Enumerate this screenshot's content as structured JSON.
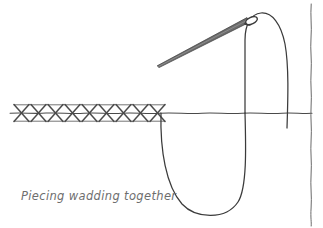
{
  "document": {
    "title": "Piecing wadding together",
    "type": "line-illustration",
    "background_color": "#ffffff",
    "width": 323,
    "height": 228
  },
  "caption": {
    "text": "Piecing wadding together",
    "color": "#6e6e6e",
    "style": "italic",
    "x": 21,
    "y": 189
  },
  "colors": {
    "ink": "#3b3b3b",
    "ink_light": "#5a5a5a",
    "needle_fill": "#6d6d6d",
    "needle_stroke": "#3b3b3b",
    "stitch": "#4a4a4a",
    "caption": "#6e6e6e",
    "background": "#ffffff"
  },
  "elements": {
    "fabric_seam_line": {
      "label": "fabric seam line",
      "y": 113,
      "x_start": 10,
      "x_end": 312,
      "color": "#4a4a4a"
    },
    "fabric_edge_line": {
      "label": "right fabric edge",
      "x": 311,
      "y_start": 4,
      "y_end": 226,
      "color": "#6a6a6a"
    },
    "herringbone_stitches": {
      "label": "herringbone cross stitches",
      "count": 9,
      "x_start": 14,
      "x_step": 17,
      "top_y": 104,
      "bottom_y": 122,
      "color": "#4a4a4a"
    },
    "thread_loop": {
      "label": "thread loop below fabric",
      "left_x": 161,
      "right_x": 245,
      "bottom_y": 216,
      "color": "#3b3b3b"
    },
    "thread_arc": {
      "label": "thread arc above fabric",
      "left_x": 245,
      "apex_x": 263,
      "apex_y": 14,
      "right_x": 287,
      "bottom_y": 128,
      "color": "#3b3b3b"
    },
    "needle": {
      "label": "sewing needle",
      "tip_x": 157,
      "tip_y": 65,
      "eye_x": 251,
      "eye_y": 21,
      "eye_rx": 6,
      "eye_ry": 3,
      "angle_deg": -25
    }
  }
}
